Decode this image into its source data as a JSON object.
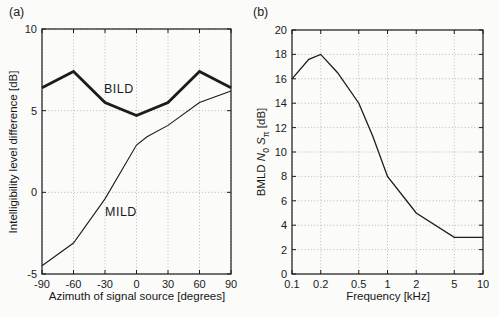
{
  "panels": [
    {
      "tag": "(a)"
    },
    {
      "tag": "(b)"
    }
  ],
  "chart_data": [
    {
      "type": "line",
      "panel": "(a)",
      "xlabel": "Azimuth of signal source [degrees]",
      "ylabel": "Intelligibility level difference [dB]",
      "xscale": "linear",
      "xlim": [
        -90,
        90
      ],
      "ylim": [
        -5,
        10
      ],
      "xticks": [
        -90,
        -60,
        -30,
        0,
        30,
        60,
        90
      ],
      "xtick_labels": [
        "-90",
        "-60",
        "-30",
        "0",
        "30",
        "60",
        "90"
      ],
      "yticks": [
        -5,
        0,
        5,
        10
      ],
      "ytick_labels": [
        "-5",
        "0",
        "5",
        "10"
      ],
      "grid": true,
      "legend_position": "inline-annotations",
      "series": [
        {
          "name": "BILD",
          "x": [
            -90,
            -60,
            -30,
            0,
            30,
            60,
            90
          ],
          "values": [
            6.4,
            7.4,
            5.5,
            4.7,
            5.5,
            7.4,
            6.4
          ],
          "line_width": 2.8
        },
        {
          "name": "MILD",
          "x": [
            -90,
            -60,
            -30,
            0,
            10,
            30,
            60,
            90
          ],
          "values": [
            -4.5,
            -3.1,
            -0.4,
            2.9,
            3.4,
            4.1,
            5.5,
            6.2
          ],
          "line_width": 1.1
        }
      ],
      "annotations": [
        {
          "text": "BILD",
          "x": -31,
          "y": 6.1
        },
        {
          "text": "MILD",
          "x": -30,
          "y": -1.45
        }
      ]
    },
    {
      "type": "line",
      "panel": "(b)",
      "xlabel": "Frequency [kHz]",
      "ylabel_text": "BMLD N0Sπ [dB]",
      "ylabel_parts": [
        {
          "t": "BMLD "
        },
        {
          "t": "N",
          "style": "italic"
        },
        {
          "t": "0",
          "sub": true
        },
        {
          "t": " "
        },
        {
          "t": "S",
          "style": "italic"
        },
        {
          "t": "π",
          "sub": true
        },
        {
          "t": " [dB]"
        }
      ],
      "xscale": "log",
      "xlim": [
        0.1,
        10
      ],
      "ylim": [
        0,
        20
      ],
      "xticks": [
        0.1,
        0.2,
        0.5,
        1,
        2,
        5,
        10
      ],
      "xtick_labels": [
        "0.1",
        "0.2",
        "0.5",
        "1",
        "2",
        "5",
        "10"
      ],
      "yticks": [
        0,
        2,
        4,
        6,
        8,
        10,
        12,
        14,
        16,
        18,
        20
      ],
      "ytick_labels": [
        "0",
        "2",
        "4",
        "6",
        "8",
        "10",
        "12",
        "14",
        "16",
        "18",
        "20"
      ],
      "grid": true,
      "series": [
        {
          "name": "BMLD N0Sπ",
          "x": [
            0.1,
            0.15,
            0.2,
            0.3,
            0.5,
            0.7,
            1,
            2,
            5,
            10
          ],
          "values": [
            16,
            17.6,
            18,
            16.5,
            14,
            11.3,
            8,
            5,
            3,
            3
          ],
          "line_width": 1.3
        }
      ],
      "annotations": []
    }
  ]
}
